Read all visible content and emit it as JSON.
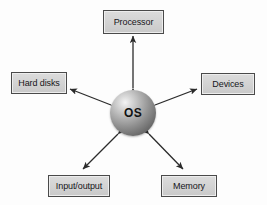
{
  "diagram": {
    "center": {
      "label": "OS",
      "shape": "sphere",
      "color": "#8e8e8e"
    },
    "nodes": [
      {
        "id": "processor",
        "label": "Processor",
        "position": "top"
      },
      {
        "id": "hard-disks",
        "label": "Hard disks",
        "position": "left"
      },
      {
        "id": "devices",
        "label": "Devices",
        "position": "right"
      },
      {
        "id": "input-output",
        "label": "Input/output",
        "position": "bottom-left"
      },
      {
        "id": "memory",
        "label": "Memory",
        "position": "bottom-right"
      }
    ],
    "connectors": [
      {
        "from": "os",
        "to": "processor",
        "style": "double-headed-arrow"
      },
      {
        "from": "os",
        "to": "hard-disks",
        "style": "double-headed-arrow"
      },
      {
        "from": "os",
        "to": "devices",
        "style": "double-headed-arrow"
      },
      {
        "from": "os",
        "to": "input-output",
        "style": "double-headed-arrow"
      },
      {
        "from": "os",
        "to": "memory",
        "style": "double-headed-arrow"
      }
    ],
    "colors": {
      "box_fill": "#d4d4d4",
      "box_border": "#4a4a4a",
      "arrow": "#2b2b2b",
      "background": "#fdfdfd",
      "text": "#16161a"
    }
  }
}
